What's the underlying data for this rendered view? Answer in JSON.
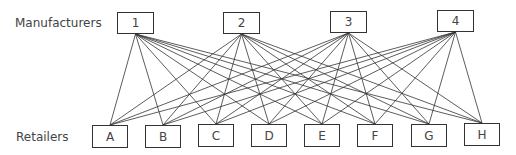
{
  "diagram": {
    "row_labels": {
      "top": "Manufacturers",
      "bottom": "Retailers"
    },
    "manufacturers": [
      {
        "id": "1",
        "x": 117,
        "y": 12
      },
      {
        "id": "2",
        "x": 223,
        "y": 12
      },
      {
        "id": "3",
        "x": 330,
        "y": 11
      },
      {
        "id": "4",
        "x": 437,
        "y": 10
      }
    ],
    "retailers": [
      {
        "id": "A",
        "x": 92,
        "y": 125
      },
      {
        "id": "B",
        "x": 145,
        "y": 125
      },
      {
        "id": "C",
        "x": 198,
        "y": 124
      },
      {
        "id": "D",
        "x": 251,
        "y": 124
      },
      {
        "id": "E",
        "x": 304,
        "y": 124
      },
      {
        "id": "F",
        "x": 357,
        "y": 124
      },
      {
        "id": "G",
        "x": 411,
        "y": 124
      },
      {
        "id": "H",
        "x": 464,
        "y": 123
      }
    ],
    "edges": "every manufacturer connects to every retailer",
    "line_color": "#333333"
  }
}
